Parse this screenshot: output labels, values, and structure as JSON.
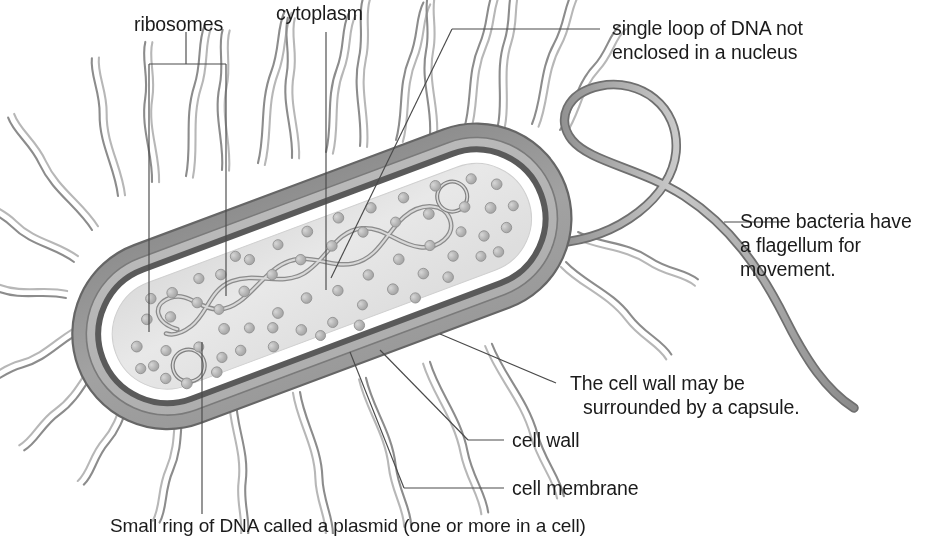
{
  "diagram": {
    "background_color": "#ffffff",
    "line_color": "#555555",
    "text_color": "#1b1b1b"
  },
  "labels": {
    "ribosomes": "ribosomes",
    "cytoplasm": "cytoplasm",
    "dna_line1": "single loop of DNA not",
    "dna_line2": "enclosed in a nucleus",
    "flagellum_line1": "Some bacteria have",
    "flagellum_line2": "a flagellum for",
    "flagellum_line3": "movement.",
    "capsule_line1": "The cell wall may be",
    "capsule_line2": "surrounded by a capsule.",
    "cell_wall": "cell wall",
    "cell_membrane": "cell membrane",
    "plasmid": "Small ring of DNA called a plasmid (one or more in a cell)"
  },
  "structures": {
    "capsule": {
      "name": "capsule",
      "fill": "#9b9b9b"
    },
    "cell_wall": {
      "name": "cell wall",
      "fill": "#b4b4b4"
    },
    "cell_membrane": {
      "name": "cell membrane",
      "fill": "#5f5f5f"
    },
    "cytoplasm": {
      "name": "cytoplasm",
      "fill": "#e2e2e2"
    },
    "ribosome": {
      "name": "ribosome",
      "fill": "#b9b9b9",
      "count": 92
    },
    "dna_loop": {
      "name": "single loop of DNA",
      "stroke": "#8c8c8c"
    },
    "plasmid": {
      "name": "plasmid ring",
      "stroke": "#8a8a8a",
      "count": 2
    },
    "pili": {
      "name": "pili",
      "stroke": "#8f8f8f",
      "count": 26
    },
    "flagellum": {
      "name": "flagellum",
      "stroke": "#7d7d7d",
      "count": 1
    }
  }
}
